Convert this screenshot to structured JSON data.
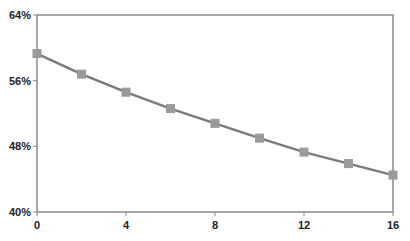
{
  "chart_data": {
    "type": "line",
    "title": "",
    "xlabel": "",
    "ylabel": "",
    "x": [
      0,
      2,
      4,
      6,
      8,
      10,
      12,
      14,
      16
    ],
    "series": [
      {
        "name": "Series 1",
        "values": [
          59.3,
          56.8,
          54.6,
          52.6,
          50.8,
          49.0,
          47.3,
          45.9,
          44.5
        ],
        "color": "#7a7a7a",
        "marker_color": "#9a9a9a",
        "marker": "square"
      }
    ],
    "xlim": [
      0,
      16
    ],
    "ylim": [
      40,
      64
    ],
    "xticks": [
      0,
      4,
      8,
      12,
      16
    ],
    "xtick_labels": [
      "0",
      "4",
      "8",
      "12",
      "16"
    ],
    "yticks": [
      40,
      48,
      56,
      64
    ],
    "ytick_labels": [
      "40%",
      "48%",
      "56%",
      "64%"
    ],
    "grid": false,
    "legend": null
  },
  "colors": {
    "axis": "#8a8a8a",
    "line": "#7a7a7a",
    "marker": "#9a9a9a",
    "text": "#222222"
  }
}
